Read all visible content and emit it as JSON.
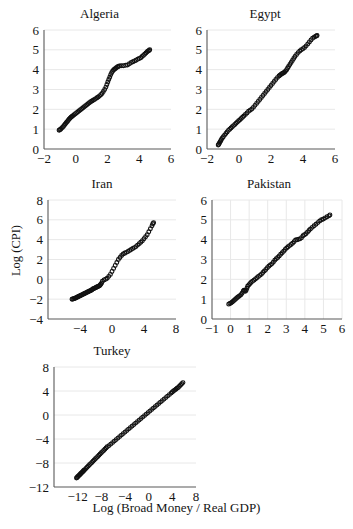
{
  "figure": {
    "axis_label_y": "Log (CPI)",
    "axis_label_x": "Log (Broad Money / Real GDP)",
    "marker_color": "#111111",
    "gridline_color": "#e8e8e8",
    "axis_color": "#595959"
  },
  "chart_data": [
    {
      "type": "scatter",
      "title": "Algeria",
      "xlabel": "",
      "ylabel": "",
      "xlim": [
        -2,
        6
      ],
      "ylim": [
        0,
        6
      ],
      "xticks": [
        -2,
        0,
        2,
        4,
        6
      ],
      "yticks": [
        0,
        1,
        2,
        3,
        4,
        5,
        6
      ],
      "grid": "horizontal",
      "x": [
        -1.05,
        -1.0,
        -0.95,
        -0.9,
        -0.84,
        -0.78,
        -0.72,
        -0.66,
        -0.6,
        -0.54,
        -0.48,
        -0.42,
        -0.36,
        -0.3,
        -0.24,
        -0.18,
        -0.1,
        -0.02,
        0.06,
        0.14,
        0.22,
        0.3,
        0.38,
        0.46,
        0.54,
        0.62,
        0.7,
        0.78,
        0.86,
        0.94,
        1.02,
        1.1,
        1.18,
        1.26,
        1.34,
        1.42,
        1.5,
        1.58,
        1.66,
        1.74,
        1.82,
        1.9,
        1.96,
        2.02,
        2.08,
        2.14,
        2.2,
        2.26,
        2.32,
        2.38,
        2.44,
        2.5,
        2.56,
        2.62,
        2.68,
        2.74,
        2.86,
        3.0,
        3.14,
        3.26,
        3.38,
        3.5,
        3.6,
        3.7,
        3.8,
        3.9,
        4.0,
        4.1,
        4.18,
        4.26,
        4.34,
        4.42,
        4.5,
        4.56,
        4.62,
        4.66
      ],
      "y": [
        0.95,
        0.97,
        1.0,
        1.04,
        1.09,
        1.14,
        1.2,
        1.26,
        1.32,
        1.38,
        1.44,
        1.5,
        1.55,
        1.6,
        1.64,
        1.68,
        1.73,
        1.78,
        1.83,
        1.88,
        1.93,
        1.98,
        2.03,
        2.08,
        2.13,
        2.18,
        2.23,
        2.28,
        2.33,
        2.38,
        2.42,
        2.46,
        2.5,
        2.54,
        2.58,
        2.62,
        2.68,
        2.74,
        2.8,
        2.9,
        3.0,
        3.12,
        3.25,
        3.38,
        3.5,
        3.62,
        3.74,
        3.84,
        3.92,
        3.98,
        4.02,
        4.06,
        4.1,
        4.14,
        4.16,
        4.18,
        4.2,
        4.2,
        4.22,
        4.24,
        4.3,
        4.36,
        4.4,
        4.44,
        4.48,
        4.52,
        4.56,
        4.6,
        4.66,
        4.72,
        4.78,
        4.84,
        4.9,
        4.94,
        4.97,
        5.0
      ]
    },
    {
      "type": "scatter",
      "title": "Egypt",
      "xlabel": "",
      "ylabel": "",
      "xlim": [
        -2,
        6
      ],
      "ylim": [
        0,
        6
      ],
      "xticks": [
        -2,
        0,
        2,
        4,
        6
      ],
      "yticks": [
        0,
        1,
        2,
        3,
        4,
        5,
        6
      ],
      "grid": "horizontal",
      "x": [
        -1.3,
        -1.26,
        -1.22,
        -1.18,
        -1.14,
        -1.1,
        -1.04,
        -0.98,
        -0.9,
        -0.82,
        -0.74,
        -0.66,
        -0.58,
        -0.5,
        -0.42,
        -0.34,
        -0.26,
        -0.18,
        -0.1,
        -0.02,
        0.06,
        0.14,
        0.22,
        0.3,
        0.4,
        0.5,
        0.6,
        0.7,
        0.8,
        0.9,
        1.0,
        1.1,
        1.2,
        1.3,
        1.4,
        1.5,
        1.6,
        1.7,
        1.8,
        1.9,
        2.0,
        2.1,
        2.2,
        2.3,
        2.4,
        2.5,
        2.56,
        2.62,
        2.68,
        2.74,
        2.8,
        2.86,
        2.92,
        2.98,
        3.04,
        3.1,
        3.18,
        3.26,
        3.34,
        3.42,
        3.5,
        3.6,
        3.7,
        3.8,
        3.9,
        4.0,
        4.1,
        4.2,
        4.3,
        4.4,
        4.5,
        4.6,
        4.7,
        4.78,
        4.84,
        4.88
      ],
      "y": [
        0.2,
        0.24,
        0.3,
        0.36,
        0.42,
        0.48,
        0.55,
        0.62,
        0.7,
        0.78,
        0.86,
        0.94,
        1.0,
        1.06,
        1.12,
        1.18,
        1.24,
        1.3,
        1.36,
        1.42,
        1.48,
        1.54,
        1.6,
        1.66,
        1.74,
        1.82,
        1.9,
        1.96,
        2.02,
        2.1,
        2.2,
        2.3,
        2.4,
        2.5,
        2.6,
        2.7,
        2.8,
        2.9,
        3.0,
        3.1,
        3.2,
        3.3,
        3.4,
        3.5,
        3.6,
        3.68,
        3.72,
        3.76,
        3.8,
        3.82,
        3.84,
        3.88,
        3.94,
        4.0,
        4.08,
        4.16,
        4.26,
        4.36,
        4.46,
        4.56,
        4.66,
        4.76,
        4.86,
        4.94,
        5.0,
        5.06,
        5.12,
        5.2,
        5.3,
        5.4,
        5.5,
        5.58,
        5.64,
        5.68,
        5.7,
        5.72
      ]
    },
    {
      "type": "scatter",
      "title": "Iran",
      "xlabel": "",
      "ylabel": "Log (CPI)",
      "xlim": [
        -8,
        8
      ],
      "ylim": [
        -4,
        8
      ],
      "xticks": [
        -4,
        0,
        4,
        8
      ],
      "yticks": [
        -4,
        -2,
        0,
        2,
        4,
        6,
        8
      ],
      "grid": "horizontal",
      "x": [
        -5.0,
        -4.9,
        -4.8,
        -4.7,
        -4.6,
        -4.5,
        -4.4,
        -4.3,
        -4.2,
        -4.1,
        -4.0,
        -3.9,
        -3.8,
        -3.7,
        -3.6,
        -3.5,
        -3.4,
        -3.3,
        -3.2,
        -3.1,
        -3.0,
        -2.9,
        -2.8,
        -2.7,
        -2.6,
        -2.5,
        -2.4,
        -2.3,
        -2.2,
        -2.1,
        -2.0,
        -1.9,
        -1.8,
        -1.7,
        -1.6,
        -1.5,
        -1.4,
        -1.3,
        -1.2,
        -1.0,
        -0.8,
        -0.6,
        -0.4,
        -0.2,
        0.0,
        0.2,
        0.4,
        0.6,
        0.8,
        1.0,
        1.2,
        1.4,
        1.6,
        1.8,
        2.0,
        2.2,
        2.4,
        2.6,
        2.8,
        3.0,
        3.2,
        3.4,
        3.6,
        3.8,
        4.0,
        4.2,
        4.4,
        4.6,
        4.8,
        5.0,
        5.1,
        5.2
      ],
      "y": [
        -2.0,
        -1.98,
        -1.96,
        -1.93,
        -1.9,
        -1.86,
        -1.82,
        -1.78,
        -1.74,
        -1.7,
        -1.66,
        -1.62,
        -1.58,
        -1.54,
        -1.5,
        -1.46,
        -1.42,
        -1.38,
        -1.34,
        -1.3,
        -1.26,
        -1.22,
        -1.18,
        -1.14,
        -1.1,
        -1.04,
        -0.98,
        -0.94,
        -0.9,
        -0.86,
        -0.82,
        -0.78,
        -0.74,
        -0.7,
        -0.66,
        -0.6,
        -0.5,
        -0.38,
        -0.2,
        -0.06,
        0.0,
        0.1,
        0.3,
        0.5,
        0.8,
        1.1,
        1.4,
        1.7,
        2.0,
        2.2,
        2.4,
        2.55,
        2.65,
        2.72,
        2.8,
        2.9,
        3.0,
        3.1,
        3.2,
        3.3,
        3.45,
        3.6,
        3.75,
        3.9,
        4.1,
        4.3,
        4.5,
        4.8,
        5.1,
        5.4,
        5.6,
        5.7
      ]
    },
    {
      "type": "scatter",
      "title": "Pakistan",
      "xlabel": "",
      "ylabel": "",
      "xlim": [
        -1,
        6
      ],
      "ylim": [
        0,
        6
      ],
      "xticks": [
        -1,
        0,
        1,
        2,
        3,
        4,
        5,
        6
      ],
      "yticks": [
        0,
        1,
        2,
        3,
        4,
        5,
        6
      ],
      "grid": "both",
      "x": [
        -0.1,
        -0.04,
        0.02,
        0.08,
        0.14,
        0.2,
        0.26,
        0.32,
        0.38,
        0.44,
        0.5,
        0.56,
        0.62,
        0.68,
        0.72,
        0.76,
        0.8,
        0.84,
        0.88,
        0.92,
        0.98,
        1.04,
        1.1,
        1.18,
        1.26,
        1.34,
        1.42,
        1.5,
        1.58,
        1.66,
        1.74,
        1.82,
        1.9,
        1.98,
        2.06,
        2.14,
        2.22,
        2.3,
        2.38,
        2.46,
        2.54,
        2.62,
        2.7,
        2.78,
        2.86,
        2.94,
        3.02,
        3.1,
        3.18,
        3.26,
        3.34,
        3.42,
        3.5,
        3.58,
        3.66,
        3.74,
        3.82,
        3.9,
        3.98,
        4.06,
        4.14,
        4.22,
        4.3,
        4.4,
        4.5,
        4.6,
        4.7,
        4.8,
        4.9,
        5.0,
        5.1,
        5.2,
        5.3,
        5.35
      ],
      "y": [
        0.75,
        0.78,
        0.81,
        0.85,
        0.9,
        0.95,
        1.0,
        1.05,
        1.1,
        1.14,
        1.18,
        1.22,
        1.3,
        1.4,
        1.45,
        1.42,
        1.4,
        1.45,
        1.55,
        1.65,
        1.72,
        1.78,
        1.84,
        1.9,
        1.96,
        2.02,
        2.08,
        2.14,
        2.2,
        2.26,
        2.34,
        2.42,
        2.5,
        2.58,
        2.66,
        2.72,
        2.78,
        2.86,
        2.96,
        3.04,
        3.1,
        3.18,
        3.26,
        3.34,
        3.42,
        3.5,
        3.58,
        3.64,
        3.7,
        3.76,
        3.82,
        3.9,
        3.98,
        4.0,
        4.02,
        4.04,
        4.1,
        4.2,
        4.25,
        4.3,
        4.38,
        4.46,
        4.54,
        4.62,
        4.7,
        4.78,
        4.86,
        4.94,
        5.0,
        5.04,
        5.1,
        5.16,
        5.2,
        5.25
      ]
    },
    {
      "type": "scatter",
      "title": "Turkey",
      "xlabel": "Log (Broad Money / Real GDP)",
      "ylabel": "",
      "xlim": [
        -16,
        8
      ],
      "ylim": [
        -12,
        8
      ],
      "xticks": [
        -12,
        -8,
        -4,
        0,
        4,
        8
      ],
      "yticks": [
        -12,
        -8,
        -4,
        0,
        4,
        8
      ],
      "grid": "horizontal",
      "x": [
        -12.2,
        -12.1,
        -12.0,
        -11.9,
        -11.8,
        -11.7,
        -11.6,
        -11.5,
        -11.4,
        -11.3,
        -11.2,
        -11.1,
        -11.0,
        -10.9,
        -10.8,
        -10.6,
        -10.4,
        -10.2,
        -10.0,
        -9.8,
        -9.6,
        -9.4,
        -9.2,
        -9.0,
        -8.8,
        -8.6,
        -8.4,
        -8.2,
        -8.0,
        -7.8,
        -7.6,
        -7.4,
        -7.2,
        -7.0,
        -6.7,
        -6.4,
        -6.1,
        -5.8,
        -5.5,
        -5.2,
        -4.9,
        -4.6,
        -4.3,
        -4.0,
        -3.7,
        -3.4,
        -3.1,
        -2.8,
        -2.5,
        -2.2,
        -1.9,
        -1.6,
        -1.3,
        -1.0,
        -0.7,
        -0.4,
        -0.1,
        0.2,
        0.5,
        0.8,
        1.1,
        1.4,
        1.7,
        2.0,
        2.3,
        2.6,
        2.9,
        3.2,
        3.5,
        3.8,
        4.0,
        4.2,
        4.4,
        4.6,
        4.8,
        5.0,
        5.2,
        5.4,
        5.6,
        5.8
      ],
      "y": [
        -10.5,
        -10.4,
        -10.3,
        -10.2,
        -10.1,
        -10.0,
        -9.9,
        -9.8,
        -9.7,
        -9.6,
        -9.5,
        -9.4,
        -9.3,
        -9.2,
        -9.1,
        -8.9,
        -8.7,
        -8.5,
        -8.3,
        -8.1,
        -7.9,
        -7.7,
        -7.5,
        -7.3,
        -7.1,
        -6.9,
        -6.7,
        -6.5,
        -6.3,
        -6.1,
        -5.9,
        -5.7,
        -5.5,
        -5.3,
        -5.1,
        -4.85,
        -4.6,
        -4.35,
        -4.1,
        -3.85,
        -3.6,
        -3.35,
        -3.1,
        -2.85,
        -2.6,
        -2.35,
        -2.1,
        -1.85,
        -1.6,
        -1.35,
        -1.1,
        -0.85,
        -0.6,
        -0.35,
        -0.1,
        0.15,
        0.4,
        0.65,
        0.9,
        1.15,
        1.4,
        1.65,
        1.9,
        2.15,
        2.4,
        2.65,
        2.9,
        3.15,
        3.4,
        3.65,
        3.85,
        4.0,
        4.15,
        4.3,
        4.45,
        4.6,
        4.8,
        5.0,
        5.2,
        5.4
      ]
    }
  ]
}
